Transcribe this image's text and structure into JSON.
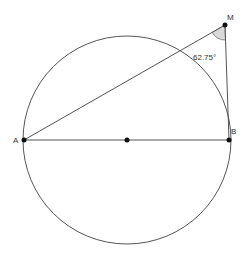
{
  "diagram": {
    "type": "geometry",
    "circle": {
      "cx": 127,
      "cy": 140,
      "r": 104,
      "stroke": "#555555"
    },
    "points": {
      "A": {
        "label": "A",
        "x": 24,
        "y": 140
      },
      "B": {
        "label": "B",
        "x": 229,
        "y": 140
      },
      "M": {
        "label": "M",
        "x": 225,
        "y": 25
      },
      "O": {
        "label": "",
        "x": 127,
        "y": 140
      }
    },
    "angle": {
      "vertex": "M",
      "label": "62.75°",
      "fill": "#d9d9d9"
    },
    "colors": {
      "line": "#555555",
      "point": "#111111",
      "angle_fill": "#d9d9d9"
    }
  }
}
